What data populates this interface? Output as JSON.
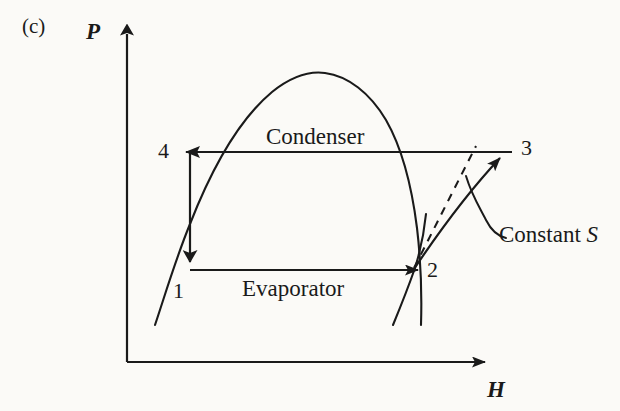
{
  "figure": {
    "panel_label": "(c)",
    "background_color": "#fbfaf7",
    "ink_color": "#1a1a1a",
    "type": "pressure-enthalpy refrigeration cycle diagram"
  },
  "axes": {
    "y_label": "P",
    "y_name": "pressure-axis",
    "x_label": "H",
    "x_name": "enthalpy-axis"
  },
  "state_points": [
    {
      "id": "1",
      "label": "1",
      "name": "state-point-1"
    },
    {
      "id": "2",
      "label": "2",
      "name": "state-point-2"
    },
    {
      "id": "3",
      "label": "3",
      "name": "state-point-3"
    },
    {
      "id": "4",
      "label": "4",
      "name": "state-point-4"
    }
  ],
  "processes": [
    {
      "id": "condenser",
      "label": "Condenser",
      "direction": "3 to 4"
    },
    {
      "id": "evaporator",
      "label": "Evaporator",
      "direction": "1 to 2"
    }
  ],
  "annotations": [
    {
      "id": "constant-s",
      "text_prefix": "Constant ",
      "text_italic": "S",
      "full": "Constant S"
    }
  ],
  "curves": {
    "vapor_dome": "saturation dome",
    "isentropic_dashed": "constant entropy reference line",
    "compression": "2 to 3 compression curve",
    "expansion": "4 to 1 throttling line"
  }
}
